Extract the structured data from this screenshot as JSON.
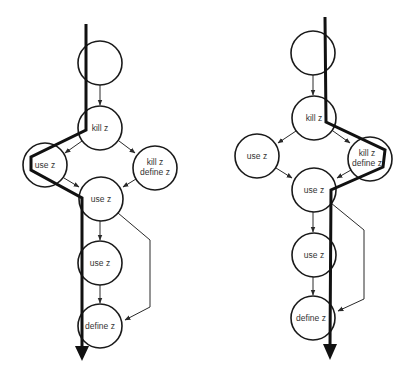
{
  "diagrams": [
    {
      "id": "left",
      "nodes": [
        {
          "id": "n0",
          "label": "",
          "cx": 100,
          "cy": 63
        },
        {
          "id": "n1",
          "label": "kill z",
          "cx": 100,
          "cy": 128
        },
        {
          "id": "n2",
          "label": "use z",
          "cx": 45,
          "cy": 165
        },
        {
          "id": "n3",
          "label": "kill z\ndefine z",
          "cx": 155,
          "cy": 168
        },
        {
          "id": "n4",
          "label": "use z",
          "cx": 101,
          "cy": 199
        },
        {
          "id": "n5",
          "label": "use z",
          "cx": 100,
          "cy": 263
        },
        {
          "id": "n6",
          "label": "define z",
          "cx": 100,
          "cy": 326
        }
      ],
      "labels": {
        "n1": "kill z",
        "n2": "use z",
        "n3_line1": "kill z",
        "n3_line2": "define z",
        "n4": "use z",
        "n5": "use z",
        "n6": "define z"
      },
      "execution_path": "86,24 86,130 31,157 31,170 82,198 82,350"
    },
    {
      "id": "right",
      "nodes": [
        {
          "id": "n0",
          "label": "",
          "cx": 313,
          "cy": 53
        },
        {
          "id": "n1",
          "label": "kill z",
          "cx": 314,
          "cy": 118
        },
        {
          "id": "n2",
          "label": "use z",
          "cx": 257,
          "cy": 156
        },
        {
          "id": "n3",
          "label": "kill z\ndefine z",
          "cx": 370,
          "cy": 159
        },
        {
          "id": "n4",
          "label": "use z",
          "cx": 314,
          "cy": 190
        },
        {
          "id": "n5",
          "label": "use z",
          "cx": 314,
          "cy": 255
        },
        {
          "id": "n6",
          "label": "define z",
          "cx": 313,
          "cy": 318
        }
      ],
      "labels": {
        "n1": "kill z",
        "n2": "use z",
        "n3_line1": "kill z",
        "n3_line2": "define z",
        "n4": "use z",
        "n5": "use z",
        "n6": "define z"
      },
      "execution_path": "325,17 326,122 385,150 383,167 331,190 330,348"
    }
  ],
  "colors": {
    "stroke": "#1a1a1a",
    "text": "#333333",
    "background": "#ffffff"
  }
}
